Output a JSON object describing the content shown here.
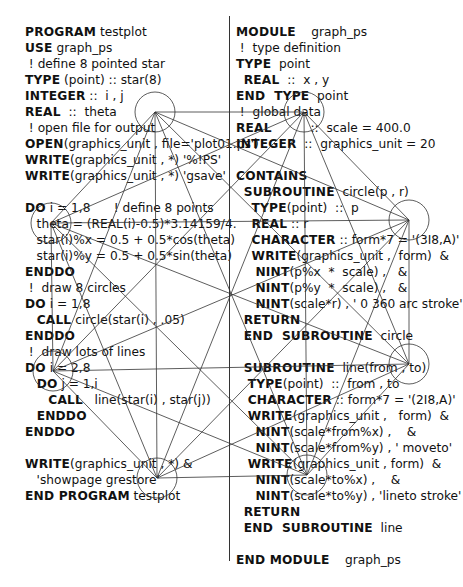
{
  "left_listing": {
    "lines": [
      "PROGRAM testplot",
      "USE graph_ps",
      " ! define 8 pointed star",
      "TYPE (point) :: star(8)",
      "INTEGER ::  i , j",
      "REAL  ::  theta",
      " ! open file for output",
      "OPEN(graphics_unit , file='plot01.ps')",
      "WRITE(graphics_unit , *) '%!PS'",
      "WRITE(graphics_unit , *) 'gsave'",
      "",
      "DO i = 1,8      ! define 8 points",
      "   theta = (REAL(i)-0.5)*3.14159/4.",
      "   star(i)%x = 0.5 + 0.5*cos(theta)",
      "   star(i)%y = 0.5 + 0.5*sin(theta)",
      "ENDDO",
      " !  draw 8 circles",
      "DO i = 1,8",
      "   CALL circle(star(i) , .05)",
      "ENDDO",
      " !  draw lots of lines",
      "DO i = 2,8",
      "   DO j = 1,i",
      "      CALL   line(star(i) , star(j))",
      "   ENDDO",
      "ENDDO",
      "",
      "WRITE(graphics_unit , *) &",
      "   'showpage grestore'",
      "END PROGRAM testplot"
    ],
    "bold_prefixes": [
      "PROGRAM",
      "USE",
      "TYPE",
      "INTEGER",
      "REAL",
      "OPEN",
      "WRITE",
      "DO",
      "ENDDO",
      "CALL",
      "END PROGRAM"
    ]
  },
  "right_listing": {
    "lines": [
      "MODULE    graph_ps",
      " !  type definition",
      "TYPE  point",
      "  REAL  ::  x , y",
      "END  TYPE  point",
      " !  global data",
      "REAL          ::  scale = 400.0",
      "INTEGER  ::  graphics_unit = 20",
      "",
      "CONTAINS",
      "  SUBROUTINE  circle(p , r)",
      "    TYPE(point)  ::  p",
      "    REAL :: r",
      "    CHARACTER :: form*7 = '(3I8,A)'",
      "    WRITE(graphics_unit ,  form)  &",
      "     NINT(p%x  *  scale) ,   &",
      "     NINT(p%y  *  scale) ,   &",
      "     NINT(scale*r) , ' 0 360 arc stroke'",
      "  RETURN",
      "  END  SUBROUTINE  circle",
      "",
      "  SUBROUTINE  line(from , to)",
      "   TYPE(point)  ::  from , to",
      "   CHARACTER :: form*7 = '(2I8,A)'",
      "   WRITE(graphics_unit ,   form)  &",
      "     NINT(scale*from%x) ,    &",
      "     NINT(scale*from%y) , ' moveto'",
      "   WRITE(graphics_unit , form)  &",
      "     NINT(scale*to%x) ,    &",
      "     NINT(scale*to%y) , 'lineto stroke'",
      "  RETURN",
      "  END  SUBROUTINE  line",
      "",
      "END MODULE    graph_ps"
    ]
  },
  "figure": {
    "points": [
      [
        155,
        112
      ],
      [
        304,
        112
      ],
      [
        409,
        220
      ],
      [
        409,
        364
      ],
      [
        307,
        475
      ],
      [
        157,
        478
      ],
      [
        53,
        371
      ],
      [
        51,
        223
      ]
    ],
    "circle_radius": 20,
    "stroke_color": "#333333"
  }
}
